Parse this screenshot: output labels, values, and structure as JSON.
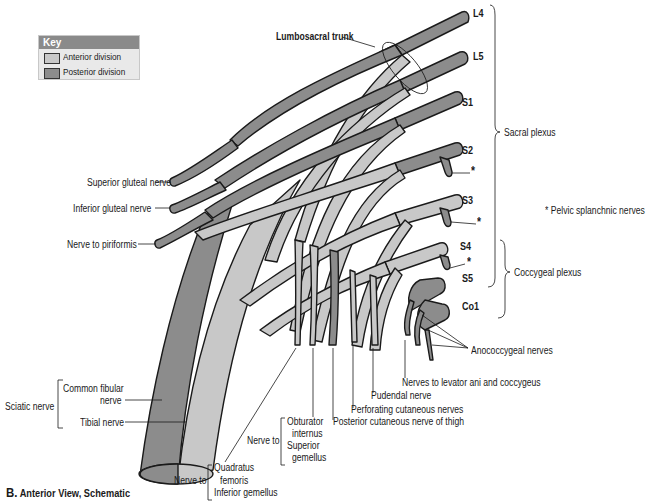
{
  "key": {
    "title": "Key",
    "items": [
      {
        "label": "Anterior division",
        "color": "#c8c8c8"
      },
      {
        "label": "Posterior division",
        "color": "#8c8c8c"
      }
    ]
  },
  "colors": {
    "anterior": "#c8c8c8",
    "posterior": "#8c8c8c",
    "outline": "#1a1a1a",
    "key_header": "#8a8a8a",
    "key_bg": "#e9e9e9"
  },
  "roots": [
    "L4",
    "L5",
    "S1",
    "S2",
    "S3",
    "S4",
    "S5",
    "Co1"
  ],
  "labels": {
    "lumbosacral_trunk": "Lumbosacral trunk",
    "superior_gluteal": "Superior gluteal nerve",
    "inferior_gluteal": "Inferior gluteal nerve",
    "nerve_to_piriformis": "Nerve to piriformis",
    "sciatic_nerve": "Sciatic nerve",
    "common_fibular_1": "Common fibular",
    "common_fibular_2": "nerve",
    "tibial_nerve": "Tibial nerve",
    "nerve_to_a": "Nerve to",
    "quadratus_1": "Quadratus",
    "quadratus_2": "femoris",
    "quadratus_3": "Inferior gemellus",
    "nerve_to_b": "Nerve to",
    "obturator_1": "Obturator",
    "obturator_2": "internus",
    "obturator_3": "Superior",
    "obturator_4": "gemellus",
    "posterior_cutaneous": "Posterior cutaneous nerve of thigh",
    "perforating_cutaneous": "Perforating cutaneous nerves",
    "pudendal": "Pudendal nerve",
    "levator_ani": "Nerves to levator ani and coccygeus",
    "anococcygeal": "Anococcygeal nerves",
    "sacral_plexus": "Sacral plexus",
    "coccygeal_plexus": "Coccygeal plexus",
    "pelvic_splanchnic": "* Pelvic splanchnic nerves",
    "asterisk": "*"
  },
  "caption": {
    "letter": "B.",
    "text": "Anterior View, Schematic"
  }
}
